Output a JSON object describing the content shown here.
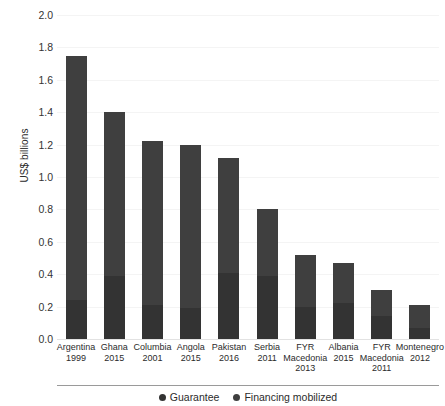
{
  "chart_data": {
    "type": "bar",
    "subtype": "stacked-column",
    "title": "",
    "xlabel": "",
    "ylabel": "US$ billions",
    "ylim": [
      0.0,
      2.0
    ],
    "ytick_step": 0.2,
    "ytick_labels": [
      "2.0",
      "1.8",
      "1.6",
      "1.4",
      "1.2",
      "1.0",
      "0.8",
      "0.6",
      "0.4",
      "0.2",
      "0.0"
    ],
    "ytick_values": [
      2.0,
      1.8,
      1.6,
      1.4,
      1.2,
      1.0,
      0.8,
      0.6,
      0.4,
      0.2,
      0.0
    ],
    "grid": true,
    "legend_position": "bottom",
    "categories": [
      {
        "name": "Argentina",
        "year": "1999"
      },
      {
        "name": "Ghana",
        "year": "2015"
      },
      {
        "name": "Columbia",
        "year": "2001"
      },
      {
        "name": "Angola",
        "year": "2015"
      },
      {
        "name": "Pakistan",
        "year": "2016"
      },
      {
        "name": "Serbia",
        "year": "2011"
      },
      {
        "name": "FYR Macedonia",
        "year": "2013"
      },
      {
        "name": "Albania",
        "year": "2015"
      },
      {
        "name": "FYR Macedonia",
        "year": "2011"
      },
      {
        "name": "Montenegro",
        "year": "2012"
      }
    ],
    "series": [
      {
        "name": "Guarantee",
        "color": "#333333",
        "values": [
          0.24,
          0.39,
          0.21,
          0.19,
          0.41,
          0.39,
          0.2,
          0.22,
          0.14,
          0.07
        ]
      },
      {
        "name": "Financing mobilized",
        "color": "#3f3f3f",
        "values": [
          1.51,
          1.01,
          1.01,
          1.01,
          0.71,
          0.41,
          0.32,
          0.25,
          0.16,
          0.14
        ]
      }
    ],
    "totals": [
      1.75,
      1.4,
      1.22,
      1.2,
      1.12,
      0.8,
      0.52,
      0.47,
      0.3,
      0.21
    ]
  },
  "legend": {
    "items": [
      {
        "label": "Guarantee",
        "color": "#333333"
      },
      {
        "label": "Financing mobilized",
        "color": "#3f3f3f"
      }
    ]
  }
}
